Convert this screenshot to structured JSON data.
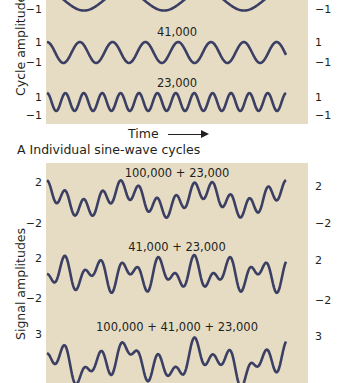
{
  "chart_data": [
    {
      "type": "line",
      "panel": "A",
      "title": "A  Individual sine-wave cycles",
      "xlabel": "Time",
      "ylabel": "Cycle amplitudes",
      "grid": false,
      "series": [
        {
          "name": "100,000",
          "label": "",
          "period_years": 100000,
          "amplitude": 1,
          "ylim": [
            -1,
            1
          ],
          "tick_labels": [
            "-1"
          ]
        },
        {
          "name": "41,000",
          "label": "41,000",
          "period_years": 41000,
          "amplitude": 1,
          "ylim": [
            -1,
            1
          ],
          "tick_labels": [
            "1",
            "-1"
          ]
        },
        {
          "name": "23,000",
          "label": "23,000",
          "period_years": 23000,
          "amplitude": 1,
          "ylim": [
            -1,
            1
          ],
          "tick_labels": [
            "1",
            "-1"
          ]
        }
      ]
    },
    {
      "type": "line",
      "panel": "B",
      "ylabel": "Signal amplitudes",
      "grid": false,
      "series": [
        {
          "name": "100,000 + 23,000",
          "components": [
            100000,
            23000
          ],
          "ylim": [
            -2,
            2
          ],
          "tick_labels": [
            "2",
            "-2"
          ]
        },
        {
          "name": "41,000 + 23,000",
          "components": [
            41000,
            23000
          ],
          "ylim": [
            -2,
            2
          ],
          "tick_labels": [
            "2",
            "-2"
          ]
        },
        {
          "name": "100,000 + 41,000 + 23,000",
          "components": [
            100000,
            41000,
            23000
          ],
          "ylim": [
            -3,
            3
          ],
          "tick_labels": [
            "3"
          ]
        }
      ]
    }
  ],
  "panelA": {
    "ylabel": "Cycle amplitudes",
    "xlabel": "Time",
    "caption": "A  Individual sine-wave cycles",
    "labels": {
      "w41": "41,000",
      "w23": "23,000"
    },
    "ticks": {
      "top_neg": "−1",
      "pos": "1",
      "neg": "−1"
    }
  },
  "panelB": {
    "ylabel": "Signal amplitudes",
    "labels": {
      "s1": "100,000 + 23,000",
      "s2": "41,000 + 23,000",
      "s3": "100,000 + 41,000 + 23,000"
    },
    "ticks": {
      "two": "2",
      "neg_two": "−2",
      "three": "3"
    }
  },
  "colors": {
    "background": "#e6dcc4",
    "line": "#3b3f63",
    "text": "#231f20"
  }
}
